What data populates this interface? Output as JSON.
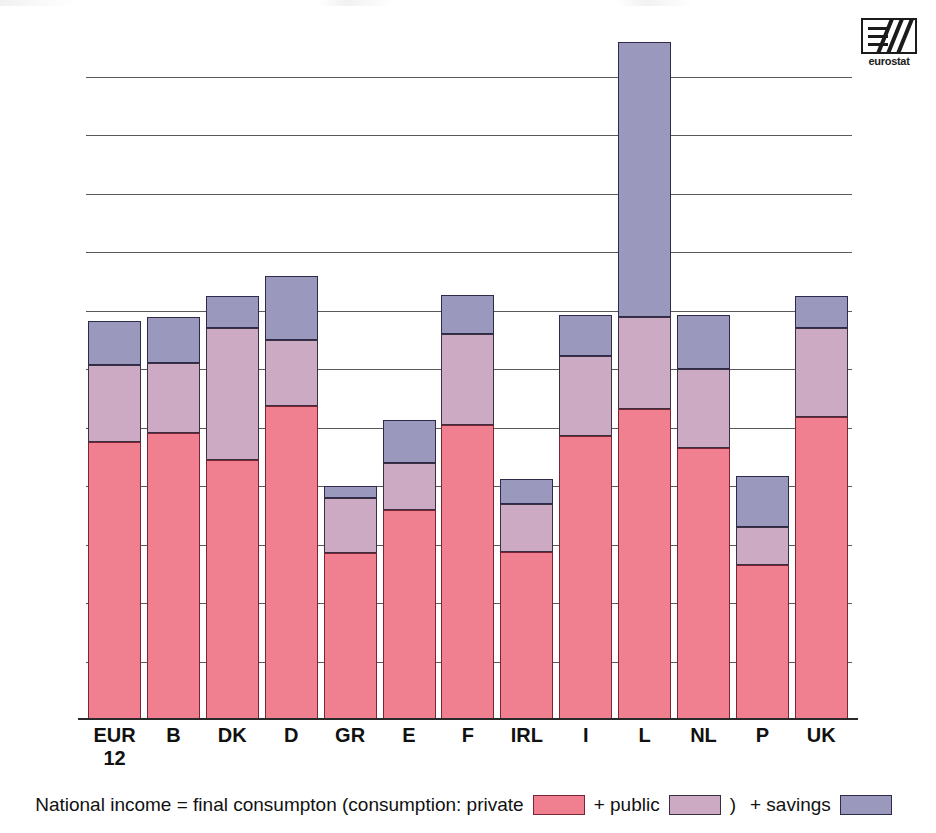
{
  "logo": {
    "name": "eurostat-logo",
    "caption": "eurostat"
  },
  "chart_data": {
    "type": "bar",
    "stacked": true,
    "title": "",
    "subtitle": "",
    "xlabel": "",
    "ylabel": "",
    "grid": true,
    "ylim": [
      0,
      23600
    ],
    "yticks": [
      0,
      2000,
      4000,
      6000,
      8000,
      10000,
      12000,
      14000,
      16000,
      18000,
      20000,
      22000
    ],
    "ytick_labels": [
      "0",
      "2 000",
      "4 000",
      "6 000",
      "8 000",
      "10 000",
      "12 000",
      "14 000",
      "16 000",
      "18 000",
      "20 000",
      "22 000"
    ],
    "categories": [
      "EUR 12",
      "B",
      "DK",
      "D",
      "GR",
      "E",
      "F",
      "IRL",
      "I",
      "L",
      "NL",
      "P",
      "UK"
    ],
    "category_lines": [
      [
        "EUR",
        "12"
      ],
      [
        "B"
      ],
      [
        "DK"
      ],
      [
        "D"
      ],
      [
        "GR"
      ],
      [
        "E"
      ],
      [
        "F"
      ],
      [
        "IRL"
      ],
      [
        "I"
      ],
      [
        "L"
      ],
      [
        "NL"
      ],
      [
        "P"
      ],
      [
        "UK"
      ]
    ],
    "series": [
      {
        "name": "private",
        "label": "consumption: private",
        "color": "#f0808f",
        "values": [
          9500,
          9800,
          8900,
          10750,
          5700,
          7200,
          10100,
          5750,
          9700,
          10650,
          9300,
          5300,
          10350
        ]
      },
      {
        "name": "public",
        "label": "+ public",
        "color": "#ccaac4",
        "values": [
          2650,
          2400,
          4500,
          2250,
          1900,
          1600,
          3100,
          1650,
          2750,
          3150,
          2700,
          1300,
          3050
        ]
      },
      {
        "name": "savings",
        "label": "+ savings",
        "color": "#9a99bd",
        "values": [
          1500,
          1600,
          1100,
          2200,
          400,
          1450,
          1350,
          850,
          1400,
          9400,
          1850,
          1750,
          1100
        ]
      }
    ],
    "cumulative_totals": [
      13650,
      13800,
      14500,
      15200,
      8000,
      10250,
      14550,
      8250,
      13850,
      23200,
      13850,
      8350,
      14500
    ],
    "legend_position": "bottom",
    "legend_prefix": "National income = final consumpton (consumption: private",
    "legend_mid": "+ public",
    "legend_paren": ")",
    "legend_suffix": "+ savings"
  }
}
